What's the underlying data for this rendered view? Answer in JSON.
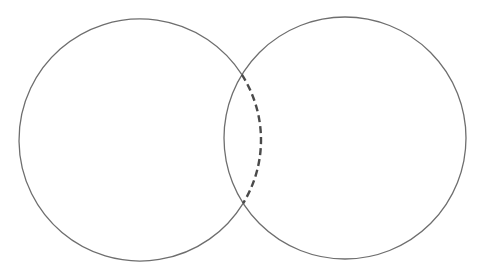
{
  "diagram": {
    "type": "venn",
    "stroke_color": "#6e6e6e",
    "dash_color": "#4a4a4a",
    "circles": [
      {
        "name": "left-circle",
        "cx": 140,
        "cy": 140,
        "r": 121
      },
      {
        "name": "right-circle",
        "cx": 345,
        "cy": 138,
        "r": 121
      }
    ],
    "dashed_arc": {
      "description": "right arc of left circle inside intersection"
    }
  }
}
